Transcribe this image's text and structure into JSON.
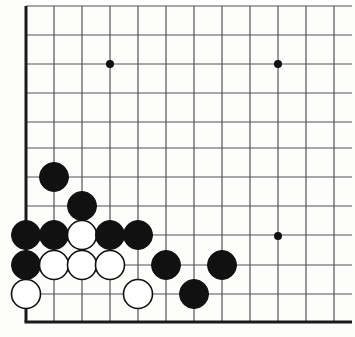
{
  "diagram": {
    "kind": "go-board-diagram",
    "board": {
      "colors": {
        "background": "#ffffff",
        "grid_line": "#555555",
        "edge_line": "#1a1a1a",
        "black_stone_fill": "#111111",
        "black_stone_stroke": "#111111",
        "white_stone_fill": "#ffffff",
        "white_stone_stroke": "#111111",
        "star_point": "#111111"
      },
      "geometry": {
        "col_x": [
          26,
          54,
          82,
          110,
          138,
          166,
          194,
          222,
          250,
          278,
          306,
          334
        ],
        "row_y": [
          6,
          35,
          64,
          93,
          122,
          148,
          177,
          206,
          235,
          265,
          294,
          322
        ],
        "spacing_x": 28,
        "spacing_y": 29,
        "stone_radius": 14.5,
        "edge_line_width": 3,
        "grid_line_width": 1.2,
        "star_radius": 4,
        "left_edge_x": 26,
        "bottom_edge_y": 322,
        "grid_right_x": 352,
        "grid_top_y": 6
      },
      "star_points": [
        {
          "name": "star-point-upper-left",
          "cx": 110,
          "cy": 64
        },
        {
          "name": "star-point-upper-right",
          "cx": 278,
          "cy": 64
        },
        {
          "name": "star-point-lower-right",
          "cx": 278,
          "cy": 236
        }
      ],
      "stones": [
        {
          "color": "black",
          "cx": 54,
          "cy": 177,
          "label": ""
        },
        {
          "color": "black",
          "cx": 82,
          "cy": 206,
          "label": ""
        },
        {
          "color": "black",
          "cx": 26,
          "cy": 235,
          "label": ""
        },
        {
          "color": "black",
          "cx": 54,
          "cy": 235,
          "label": ""
        },
        {
          "color": "white",
          "cx": 82,
          "cy": 235,
          "label": ""
        },
        {
          "color": "black",
          "cx": 110,
          "cy": 235,
          "label": ""
        },
        {
          "color": "black",
          "cx": 138,
          "cy": 235,
          "label": ""
        },
        {
          "color": "black",
          "cx": 26,
          "cy": 265,
          "label": ""
        },
        {
          "color": "white",
          "cx": 54,
          "cy": 265,
          "label": ""
        },
        {
          "color": "white",
          "cx": 82,
          "cy": 265,
          "label": ""
        },
        {
          "color": "white",
          "cx": 110,
          "cy": 265,
          "label": ""
        },
        {
          "color": "black",
          "cx": 166,
          "cy": 265,
          "label": ""
        },
        {
          "color": "black",
          "cx": 222,
          "cy": 265,
          "label": ""
        },
        {
          "color": "white",
          "cx": 26,
          "cy": 294,
          "label": ""
        },
        {
          "color": "white",
          "cx": 138,
          "cy": 294,
          "label": ""
        },
        {
          "color": "black",
          "cx": 194,
          "cy": 294,
          "label": ""
        }
      ],
      "stone_counts": {
        "black": 10,
        "white": 6,
        "total": 16
      }
    }
  }
}
